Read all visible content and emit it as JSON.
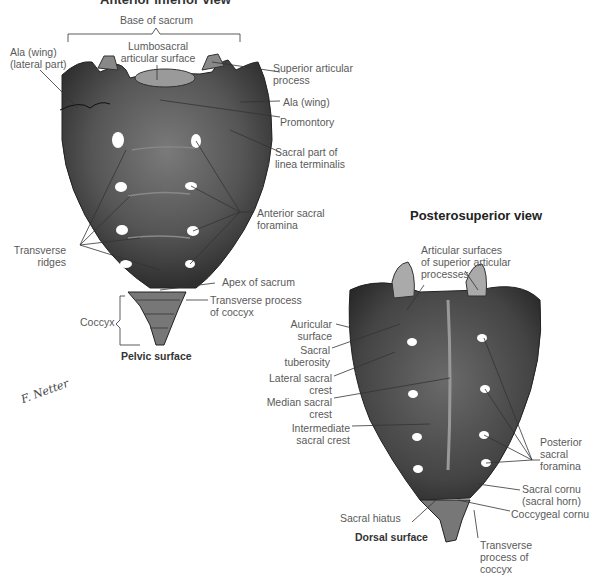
{
  "anterior_view": {
    "title": "Anterior inferior view",
    "caption": "Pelvic surface",
    "labels": {
      "base_of_sacrum": "Base of sacrum",
      "lumbosacral_line1": "Lumbosacral",
      "lumbosacral_line2": "articular surface",
      "ala_lateral_line1": "Ala (wing)",
      "ala_lateral_line2": "(lateral part)",
      "superior_articular_line1": "Superior articular",
      "superior_articular_line2": "process",
      "ala_wing": "Ala (wing)",
      "promontory": "Promontory",
      "linea_line1": "Sacral part of",
      "linea_line2": "linea terminalis",
      "anterior_foramina_line1": "Anterior sacral",
      "anterior_foramina_line2": "foramina",
      "transverse_ridges_line1": "Transverse",
      "transverse_ridges_line2": "ridges",
      "apex": "Apex of sacrum",
      "transverse_process_line1": "Transverse process",
      "transverse_process_line2": "of coccyx",
      "coccyx": "Coccyx"
    }
  },
  "posterior_view": {
    "title": "Posterosuperior view",
    "caption": "Dorsal surface",
    "labels": {
      "articular_line1": "Articular surfaces",
      "articular_line2": "of superior articular",
      "articular_line3": "processes",
      "auricular_line1": "Auricular",
      "auricular_line2": "surface",
      "tuberosity_line1": "Sacral",
      "tuberosity_line2": "tuberosity",
      "lateral_crest_line1": "Lateral sacral",
      "lateral_crest_line2": "crest",
      "median_crest_line1": "Median sacral",
      "median_crest_line2": "crest",
      "intermediate_line1": "Intermediate",
      "intermediate_line2": "sacral crest",
      "posterior_foramina_line1": "Posterior",
      "posterior_foramina_line2": "sacral",
      "posterior_foramina_line3": "foramina",
      "cornu_line1": "Sacral cornu",
      "cornu_line2": "(sacral horn)",
      "hiatus": "Sacral hiatus",
      "coccygeal_cornu": "Coccygeal cornu",
      "tp_line1": "Transverse",
      "tp_line2": "process of",
      "tp_line3": "coccyx"
    }
  },
  "signature": "F. Netter",
  "colors": {
    "bone_dark": "#3a3a3a",
    "bone_mid": "#6e6e6e",
    "bone_light": "#a8a8a8",
    "leader": "#333333",
    "text": "#5a5a5a"
  }
}
